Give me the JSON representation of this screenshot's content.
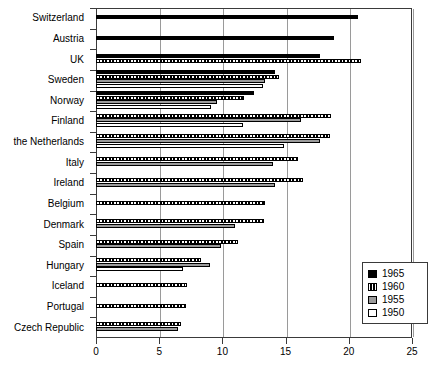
{
  "chart_data": {
    "type": "bar",
    "orientation": "horizontal",
    "title": "",
    "xlabel": "",
    "ylabel": "",
    "xlim": [
      0,
      25
    ],
    "xticks": [
      0,
      5,
      10,
      15,
      20,
      25
    ],
    "xtick_labels": [
      "0",
      "5",
      "10",
      "15",
      "20",
      "25"
    ],
    "grid": true,
    "grid_axis": "x",
    "legend_position": "lower-right",
    "categories": [
      "Switzerland",
      "Austria",
      "UK",
      "Sweden",
      "Norway",
      "Finland",
      "the Netherlands",
      "Italy",
      "Ireland",
      "Belgium",
      "Denmark",
      "Spain",
      "Hungary",
      "Iceland",
      "Portugal",
      "Czech Republic"
    ],
    "series": [
      {
        "name": "1965",
        "color": "#000000",
        "pattern": "solid",
        "values": [
          20.7,
          18.8,
          17.7,
          14.2,
          12.5,
          null,
          null,
          null,
          null,
          null,
          null,
          null,
          null,
          null,
          null,
          null
        ]
      },
      {
        "name": "1960",
        "color": "#000000",
        "pattern": "dotted",
        "values": [
          null,
          null,
          21.0,
          14.5,
          11.7,
          18.6,
          18.5,
          16.0,
          16.4,
          13.4,
          13.3,
          11.2,
          8.3,
          7.2,
          7.1,
          6.7
        ]
      },
      {
        "name": "1955",
        "color": "#9b9b9b",
        "pattern": "gray",
        "values": [
          null,
          null,
          null,
          13.4,
          9.6,
          16.2,
          17.7,
          14.0,
          14.2,
          null,
          11.0,
          9.9,
          9.0,
          null,
          null,
          6.5
        ]
      },
      {
        "name": "1950",
        "color": "#ffffff",
        "pattern": "open",
        "values": [
          null,
          null,
          null,
          13.2,
          9.1,
          11.6,
          14.9,
          null,
          null,
          null,
          null,
          null,
          6.9,
          null,
          null,
          null
        ]
      }
    ]
  },
  "legend": {
    "items": [
      {
        "label": "1965",
        "swatch": "s1965"
      },
      {
        "label": "1960",
        "swatch": "s1960"
      },
      {
        "label": "1955",
        "swatch": "s1955"
      },
      {
        "label": "1950",
        "swatch": "s1950"
      }
    ]
  }
}
